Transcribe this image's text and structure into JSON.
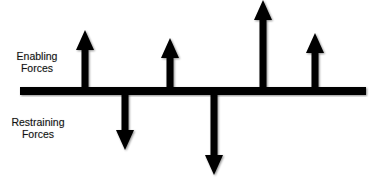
{
  "diagram": {
    "labels": {
      "enabling": [
        "Enabling",
        "Forces"
      ],
      "restraining": [
        "Restraining",
        "Forces"
      ]
    },
    "colors": {
      "background": "#ffffff",
      "stroke": "#000000",
      "text": "#111111"
    },
    "baseline": {
      "x1": 20,
      "x2": 366,
      "y": 91,
      "thickness": 8
    },
    "enabling_forces": [
      {
        "id": "up-1",
        "x": 85,
        "tip_y": 30
      },
      {
        "id": "up-2",
        "x": 170,
        "tip_y": 38
      },
      {
        "id": "up-3",
        "x": 263,
        "tip_y": 0
      },
      {
        "id": "up-4",
        "x": 315,
        "tip_y": 33
      }
    ],
    "restraining_forces": [
      {
        "id": "down-1",
        "x": 125,
        "tip_y": 150
      },
      {
        "id": "down-2",
        "x": 214,
        "tip_y": 175
      }
    ]
  }
}
